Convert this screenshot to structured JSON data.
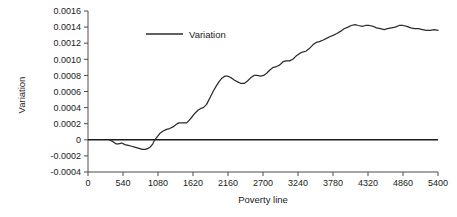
{
  "chart_data": {
    "type": "line",
    "title": "",
    "xlabel": "Poverty line",
    "ylabel": "Variation",
    "xlim": [
      0,
      5400
    ],
    "ylim": [
      -0.0004,
      0.0016
    ],
    "grid": false,
    "legend_position": "top-center-inside",
    "xticks": [
      "0",
      "540",
      "1080",
      "1620",
      "2160",
      "2700",
      "3240",
      "3780",
      "4320",
      "4860",
      "5400"
    ],
    "xtick_values": [
      0,
      540,
      1080,
      1620,
      2160,
      2700,
      3240,
      3780,
      4320,
      4860,
      5400
    ],
    "yticks": [
      "0.0016",
      "0.0014",
      "0.0012",
      "0.0010",
      "0.0008",
      "0.0006",
      "0.0004",
      "0.0002",
      "0",
      "-0.0002",
      "-0.0004"
    ],
    "ytick_values": [
      0.0016,
      0.0014,
      0.0012,
      0.001,
      0.0008,
      0.0006,
      0.0004,
      0.0002,
      0,
      -0.0002,
      -0.0004
    ],
    "series": [
      {
        "name": "Variation",
        "color": "#2b2b2b",
        "x": [
          330,
          380,
          430,
          470,
          520,
          570,
          620,
          670,
          720,
          760,
          800,
          840,
          880,
          920,
          960,
          1000,
          1030,
          1070,
          1110,
          1160,
          1210,
          1260,
          1310,
          1360,
          1400,
          1440,
          1480,
          1520,
          1560,
          1600,
          1650,
          1700,
          1740,
          1780,
          1830,
          1880,
          1930,
          1980,
          2020,
          2060,
          2110,
          2160,
          2210,
          2260,
          2310,
          2360,
          2410,
          2460,
          2510,
          2560,
          2610,
          2660,
          2710,
          2760,
          2810,
          2860,
          2910,
          2960,
          3010,
          3060,
          3110,
          3160,
          3210,
          3260,
          3310,
          3360,
          3410,
          3470,
          3520,
          3570,
          3630,
          3680,
          3730,
          3790,
          3840,
          3900,
          3950,
          4010,
          4060,
          4120,
          4170,
          4230,
          4280,
          4340,
          4400,
          4450,
          4510,
          4570,
          4620,
          4680,
          4740,
          4800,
          4860,
          4920,
          4980,
          5040,
          5100,
          5160,
          5220,
          5280,
          5340,
          5400
        ],
        "y": [
          0.0,
          -2e-05,
          -5e-05,
          -5e-05,
          -4e-05,
          -6e-05,
          -7e-05,
          -8e-05,
          -9e-05,
          -0.0001,
          -0.00011,
          -0.00012,
          -0.00012,
          -0.00011,
          -9e-05,
          -5e-05,
          0.0,
          4e-05,
          8e-05,
          0.00011,
          0.00013,
          0.00014,
          0.00016,
          0.00019,
          0.00021,
          0.00021,
          0.00021,
          0.00021,
          0.00024,
          0.00028,
          0.00033,
          0.00037,
          0.00039,
          0.0004,
          0.00044,
          0.00052,
          0.0006,
          0.00067,
          0.00072,
          0.00076,
          0.00079,
          0.00079,
          0.00077,
          0.00074,
          0.00072,
          0.0007,
          0.0007,
          0.00073,
          0.00077,
          0.0008,
          0.0008,
          0.00079,
          0.0008,
          0.00083,
          0.00087,
          0.0009,
          0.00091,
          0.00093,
          0.00097,
          0.00098,
          0.00098,
          0.001,
          0.00104,
          0.00107,
          0.00109,
          0.0011,
          0.00113,
          0.00118,
          0.00121,
          0.00122,
          0.00124,
          0.00126,
          0.00128,
          0.0013,
          0.00132,
          0.00135,
          0.00138,
          0.0014,
          0.00142,
          0.00143,
          0.00142,
          0.00141,
          0.00142,
          0.00142,
          0.00141,
          0.00139,
          0.00138,
          0.00137,
          0.00138,
          0.00139,
          0.0014,
          0.00142,
          0.00142,
          0.00141,
          0.00139,
          0.00138,
          0.00138,
          0.00137,
          0.00136,
          0.00136,
          0.00137,
          0.00136
        ]
      }
    ],
    "legend": [
      {
        "label": "Variation",
        "color": "#2b2b2b"
      }
    ]
  }
}
